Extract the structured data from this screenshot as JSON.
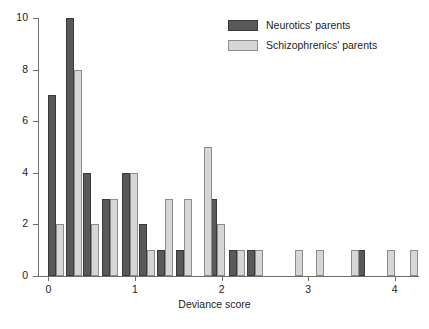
{
  "chart_data": {
    "type": "bar",
    "title": "",
    "xlabel": "Deviance score",
    "ylabel": "",
    "xlim": [
      -0.12,
      4.28
    ],
    "ylim": [
      0,
      10
    ],
    "grid": false,
    "legend_position": "top-right",
    "xticks": [
      0,
      1,
      2,
      3,
      4
    ],
    "xtick_labels": [
      "0",
      "1",
      "2",
      "3",
      "4"
    ],
    "yticks": [
      0,
      2,
      4,
      6,
      8,
      10
    ],
    "ytick_labels": [
      "0",
      "2",
      "4",
      "6",
      "8",
      "10"
    ],
    "series": [
      {
        "name": "Neurotics' parents",
        "color": "#595959",
        "points": [
          {
            "x": 0.0,
            "y": 7
          },
          {
            "x": 0.2,
            "y": 10
          },
          {
            "x": 0.4,
            "y": 4
          },
          {
            "x": 0.62,
            "y": 3
          },
          {
            "x": 0.85,
            "y": 4
          },
          {
            "x": 1.05,
            "y": 2
          },
          {
            "x": 1.25,
            "y": 1
          },
          {
            "x": 1.47,
            "y": 1
          },
          {
            "x": 1.86,
            "y": 3
          },
          {
            "x": 2.08,
            "y": 1
          },
          {
            "x": 2.29,
            "y": 1
          },
          {
            "x": 3.56,
            "y": 1
          }
        ]
      },
      {
        "name": "Schizophrenics' parents",
        "color": "#d6d6d6",
        "points": [
          {
            "x": 0.0,
            "y": 2
          },
          {
            "x": 0.2,
            "y": 8
          },
          {
            "x": 0.4,
            "y": 2
          },
          {
            "x": 0.62,
            "y": 3
          },
          {
            "x": 0.85,
            "y": 4
          },
          {
            "x": 1.05,
            "y": 1
          },
          {
            "x": 1.25,
            "y": 3
          },
          {
            "x": 1.47,
            "y": 3
          },
          {
            "x": 1.7,
            "y": 5
          },
          {
            "x": 1.86,
            "y": 2
          },
          {
            "x": 2.08,
            "y": 1
          },
          {
            "x": 2.29,
            "y": 1
          },
          {
            "x": 2.75,
            "y": 1
          },
          {
            "x": 3.0,
            "y": 1
          },
          {
            "x": 3.4,
            "y": 1
          },
          {
            "x": 3.82,
            "y": 1
          },
          {
            "x": 4.08,
            "y": 1
          }
        ]
      }
    ]
  },
  "legend": {
    "entries": [
      {
        "label": "Neurotics' parents",
        "swatch": "neurotic"
      },
      {
        "label": "Schizophrenics' parents",
        "swatch": "schizo"
      }
    ]
  },
  "axis": {
    "x_title": "Deviance score"
  },
  "caption": {
    "text": ""
  }
}
